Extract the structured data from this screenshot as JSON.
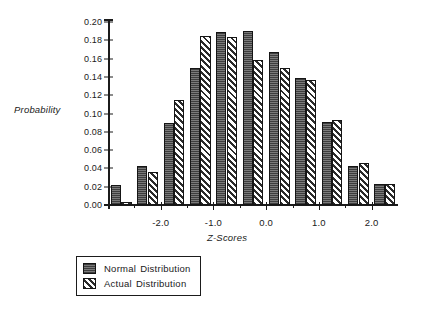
{
  "chart_data": {
    "type": "bar",
    "title": "",
    "subtitle": "",
    "xlabel": "Z-Scores",
    "ylabel": "Probability",
    "ylim": [
      0.0,
      0.2
    ],
    "xlim": [
      -3.0,
      2.5
    ],
    "grid": false,
    "legend_position": "bottom-left",
    "ytick_labels": [
      "0.20",
      "0.18",
      "0.16",
      "0.14",
      "0.12",
      "0.10",
      "0.08",
      "0.06",
      "0.04",
      "0.02",
      "0.00"
    ],
    "ytick_values": [
      0.2,
      0.18,
      0.16,
      0.14,
      0.12,
      0.1,
      0.08,
      0.06,
      0.04,
      0.02,
      0.0
    ],
    "xtick_labels": [
      "-2.0",
      "-1.0",
      "0.0",
      "1.0",
      "2.0"
    ],
    "xtick_values": [
      -2.0,
      -1.0,
      0.0,
      1.0,
      2.0
    ],
    "x_bin_centers": [
      -2.75,
      -2.25,
      -1.75,
      -1.25,
      -0.75,
      -0.25,
      0.25,
      0.75,
      1.25,
      1.75,
      2.25
    ],
    "categories": [
      "-2.75",
      "-2.25",
      "-1.75",
      "-1.25",
      "-0.75",
      "-0.25",
      "0.25",
      "0.75",
      "1.25",
      "1.75",
      "2.25"
    ],
    "series": [
      {
        "name": "Normal Distribution",
        "color": "#5d5d5d",
        "pattern": "stipple",
        "values": [
          0.022,
          0.043,
          0.09,
          0.15,
          0.189,
          0.19,
          0.167,
          0.139,
          0.091,
          0.043,
          0.023
        ]
      },
      {
        "name": "Actual Distribution",
        "color": "#ffffff",
        "pattern": "diagonal-hatch",
        "values": [
          0.003,
          0.036,
          0.115,
          0.185,
          0.184,
          0.158,
          0.15,
          0.137,
          0.093,
          0.046,
          0.023
        ]
      }
    ],
    "legend": [
      {
        "label_part1": "Normal",
        "label_part2": "Distribution",
        "swatch": "normal"
      },
      {
        "label_part1": "Actual",
        "label_part2": "Distribution",
        "swatch": "actual"
      }
    ]
  }
}
